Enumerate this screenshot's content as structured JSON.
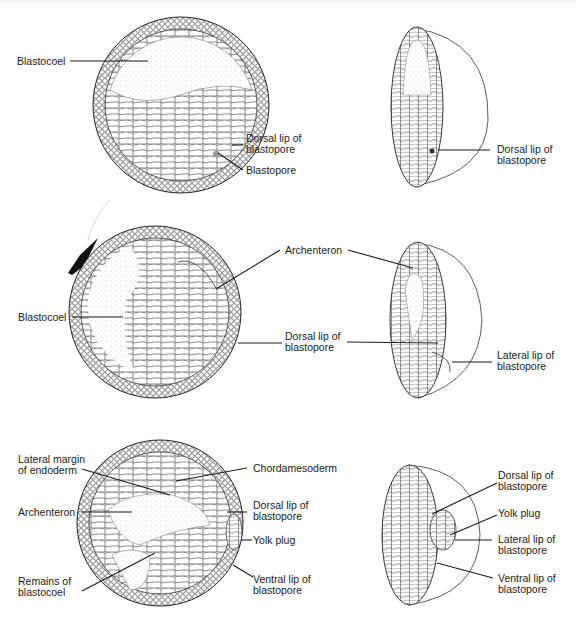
{
  "figure": {
    "colors": {
      "ink": "#1b1b1b",
      "stipple": "#9a9a9a",
      "background": "#ffffff",
      "smudge": "#111111"
    },
    "stages": [
      {
        "id": "early-gastrula",
        "section_labels": {
          "blastocoel": "Blastocoel",
          "dorsal_lip_1": "Dorsal lip of",
          "dorsal_lip_2": "blastopore",
          "blastopore": "Blastopore"
        },
        "hemisphere_labels": {
          "dorsal_lip_1": "Dorsal lip of",
          "dorsal_lip_2": "blastopore"
        }
      },
      {
        "id": "mid-gastrula",
        "section_labels": {
          "blastocoel": "Blastocoel"
        },
        "shared_labels": {
          "archenteron": "Archenteron",
          "dorsal_lip_1": "Dorsal lip of",
          "dorsal_lip_2": "blastopore"
        },
        "hemisphere_labels": {
          "lateral_lip_1": "Lateral lip of",
          "lateral_lip_2": "blastopore"
        }
      },
      {
        "id": "late-gastrula",
        "section_labels": {
          "lateral_margin_1": "Lateral margin",
          "lateral_margin_2": "of endoderm",
          "archenteron": "Archenteron",
          "remains_1": "Remains of",
          "remains_2": "blastocoel",
          "chordamesoderm": "Chordamesoderm",
          "dorsal_lip_1": "Dorsal lip of",
          "dorsal_lip_2": "blastopore",
          "yolk_plug": "Yolk plug",
          "ventral_lip_1": "Ventral lip of",
          "ventral_lip_2": "blastopore"
        },
        "hemisphere_labels": {
          "dorsal_lip_1": "Dorsal lip of",
          "dorsal_lip_2": "blastopore",
          "yolk_plug": "Yolk plug",
          "lateral_lip_1": "Lateral lip of",
          "lateral_lip_2": "blastopore",
          "ventral_lip_1": "Ventral lip of",
          "ventral_lip_2": "blastopore"
        }
      }
    ]
  }
}
